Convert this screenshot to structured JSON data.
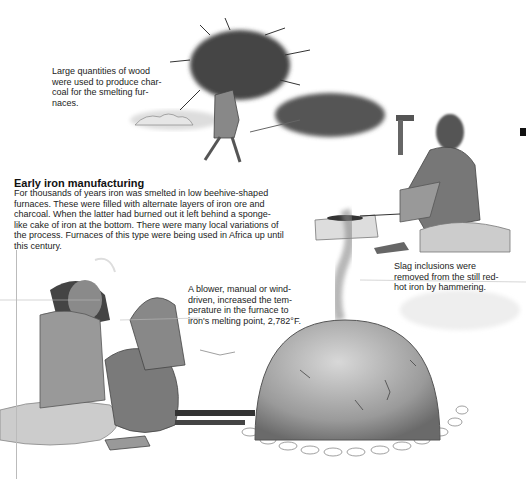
{
  "section": {
    "heading": "Early iron manufacturing",
    "body": "For thousands of years iron was smelted in low beehive-shaped furnaces. These were filled with alternate layers of iron ore and charcoal. When the latter had burned out it left behind a sponge-like cake of iron at the bottom. There were many local variations of the process. Furnaces of this type were being used in Africa up until this century."
  },
  "captions": {
    "wood": [
      "Large quantities of wood",
      "were used to produce char-",
      "coal for the smelting fur-",
      "naces."
    ],
    "blower": [
      "A blower, manual or wind-",
      "driven, increased the tem-",
      "perature in the furnace to",
      "iron's melting point, 2,782°F."
    ],
    "slag": [
      "Slag inclusions were",
      "removed from the still red-",
      "hot iron by hammering."
    ]
  },
  "illustrations": [
    {
      "id": "wood-carrier",
      "subject": "man carrying bundle of wood"
    },
    {
      "id": "blacksmith",
      "subject": "seated man hammering iron on stone"
    },
    {
      "id": "bellows-worker",
      "subject": "seated man operating bellows"
    },
    {
      "id": "furnace",
      "subject": "beehive furnace with smoke"
    }
  ]
}
